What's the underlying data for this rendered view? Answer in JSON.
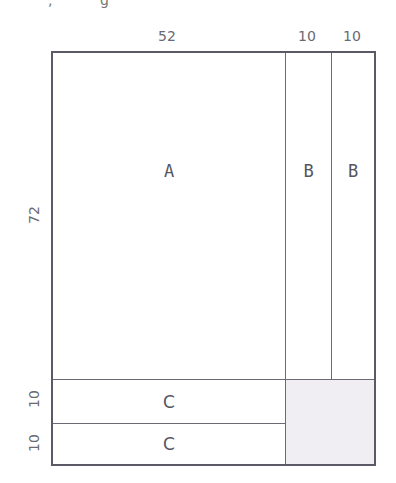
{
  "diagram": {
    "top_dimensions": [
      "52",
      "10",
      "10"
    ],
    "left_dimensions": [
      "72",
      "10",
      "10"
    ],
    "regions": [
      {
        "id": "A",
        "label": "A"
      },
      {
        "id": "B1",
        "label": "B"
      },
      {
        "id": "B2",
        "label": "B"
      },
      {
        "id": "C1",
        "label": "C"
      },
      {
        "id": "C2",
        "label": "C"
      }
    ],
    "shaded_region": "waste-corner",
    "colors": {
      "border": "#5a5a66",
      "line": "#6b6b78",
      "shade": "#f0eef2",
      "text": "#55555f"
    }
  }
}
